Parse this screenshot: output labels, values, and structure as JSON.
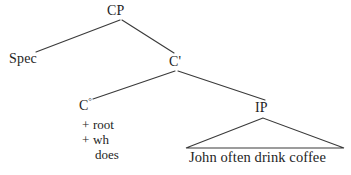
{
  "figure": {
    "kind": "x-bar-syntax-tree",
    "background_color": "#ffffff",
    "ink_color": "#242424",
    "line_color": "#3a3a3a"
  },
  "nodes": {
    "root": {
      "label": "CP"
    },
    "specifier": {
      "label": "Spec"
    },
    "c_bar": {
      "label": "C'"
    },
    "c_head": {
      "label": "C",
      "superscript": "°"
    },
    "ip": {
      "label": "IP"
    }
  },
  "features": [
    {
      "marker": "+",
      "name": "root"
    },
    {
      "marker": "+",
      "name": "wh"
    },
    {
      "marker": "",
      "name": "does"
    }
  ],
  "terminal": {
    "text": "John often drink coffee"
  },
  "edges": [
    {
      "name": "cp-to-spec",
      "from": "CP",
      "to": "Spec",
      "x1": 120,
      "y1": 20,
      "x2": 36,
      "y2": 52
    },
    {
      "name": "cp-to-cbar",
      "from": "CP",
      "to": "C'",
      "x1": 122,
      "y1": 20,
      "x2": 174,
      "y2": 53
    },
    {
      "name": "cbar-to-chead",
      "from": "C'",
      "to": "C°",
      "x1": 175,
      "y1": 71,
      "x2": 93,
      "y2": 99
    },
    {
      "name": "cbar-to-ip",
      "from": "C'",
      "to": "IP",
      "x1": 178,
      "y1": 71,
      "x2": 265,
      "y2": 100
    }
  ],
  "triangle": {
    "name": "ip-ellipsis-triangle",
    "apex_x": 263,
    "apex_y": 118,
    "left_x": 186,
    "left_y": 148,
    "right_x": 344,
    "right_y": 148
  }
}
